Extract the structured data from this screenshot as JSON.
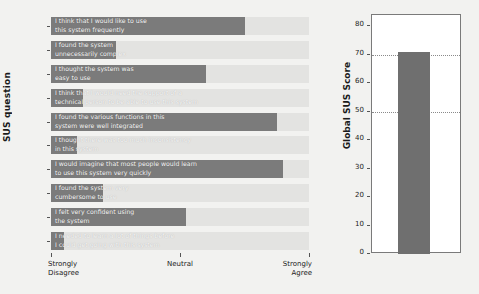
{
  "chart_data": [
    {
      "type": "bar",
      "orientation": "horizontal",
      "title": "",
      "xlabel": "",
      "ylabel": "SUS question",
      "categories": [
        "1",
        "2",
        "3",
        "4",
        "5",
        "6",
        "7",
        "8",
        "9",
        "10"
      ],
      "bar_labels": [
        "I think that I would like to use\nthis system frequently",
        "I found the system\nunnecessarily complex",
        "I thought the system was\neasy to use",
        "I think that I would need the support of a\ntechnical person to be able to use this system",
        "I found the various functions in this\nsystem were well integrated",
        "I thought there was too much inconsistency\nin this system",
        "I would imagine that most people would learn\nto use this system very quickly",
        "I found the system very\ncumbersome to use",
        "I felt very confident using\nthe system",
        "I needed to learn a lot of things before\nI could get going with this system"
      ],
      "values": [
        4.0,
        2.0,
        3.4,
        1.5,
        4.5,
        1.4,
        4.6,
        1.8,
        3.1,
        1.2
      ],
      "xlim": [
        1,
        5
      ],
      "xticks": [
        1,
        3,
        5
      ],
      "xticklabels": [
        "Strongly\nDisagree",
        "Neutral",
        "Strongly\nAgree"
      ],
      "grid": false,
      "bar_color": "#7b7b7b",
      "track_color": "#e3e3e1",
      "legend": "none"
    },
    {
      "type": "bar",
      "orientation": "vertical",
      "title": "",
      "xlabel": "",
      "ylabel": "Global SUS Score",
      "categories": [
        ""
      ],
      "values": [
        71
      ],
      "ylim": [
        0,
        84
      ],
      "yticks": [
        0,
        10,
        20,
        30,
        40,
        50,
        60,
        70,
        80
      ],
      "yticklabels": [
        "0",
        "10",
        "20",
        "30",
        "40",
        "50",
        "60",
        "70",
        "80"
      ],
      "reference_lines": [
        50,
        70
      ],
      "grid": false,
      "bar_color": "#6f6f6f",
      "legend": "none"
    }
  ],
  "left_chart": {
    "ylabel": "SUS question",
    "rows": [
      {
        "tick": "1",
        "label": "I think that I would like to use\nthis system frequently",
        "value": 4.0
      },
      {
        "tick": "2",
        "label": "I found the system\nunnecessarily complex",
        "value": 2.0
      },
      {
        "tick": "3",
        "label": "I thought the system was\neasy to use",
        "value": 3.4
      },
      {
        "tick": "4",
        "label": "I think that I would need the support of a\ntechnical person to be able to use this system",
        "value": 1.5
      },
      {
        "tick": "5",
        "label": "I found the various functions in this\nsystem were well integrated",
        "value": 4.5
      },
      {
        "tick": "6",
        "label": "I thought there was too much inconsistency\nin this system",
        "value": 1.4
      },
      {
        "tick": "7",
        "label": "I would imagine that most people would learn\nto use this system very quickly",
        "value": 4.6
      },
      {
        "tick": "8",
        "label": "I found the system very\ncumbersome to use",
        "value": 1.8
      },
      {
        "tick": "9",
        "label": "I felt very confident using\nthe system",
        "value": 3.1
      },
      {
        "tick": "10",
        "label": "I needed to learn a lot of things before\nI could get going with this system",
        "value": 1.2
      }
    ],
    "xticklabels": [
      "Strongly\nDisagree",
      "Neutral",
      "Strongly\nAgree"
    ]
  },
  "right_chart": {
    "ylabel": "Global SUS Score",
    "yticklabels": [
      "80",
      "70",
      "60",
      "50",
      "40",
      "30",
      "20",
      "10",
      "0"
    ],
    "value": 71,
    "reference_lines": [
      70,
      50
    ]
  },
  "colors": {
    "bar": "#7b7b7b",
    "track": "#e3e3e1",
    "background": "#f2f2f0",
    "text": "#1b1b1b",
    "bar_text": "#f7f7f7"
  }
}
